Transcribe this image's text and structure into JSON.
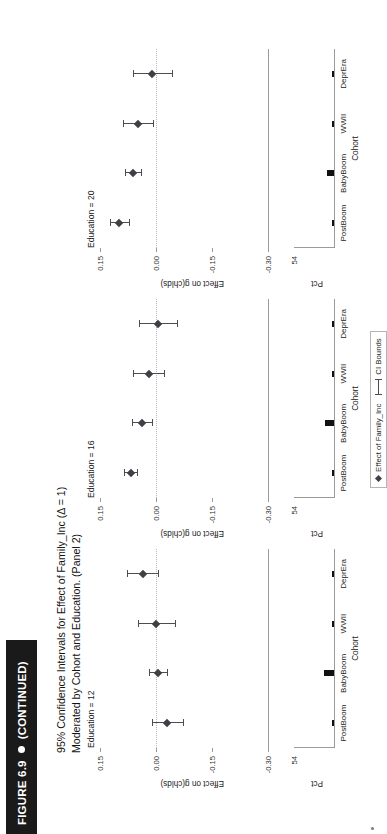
{
  "figure": {
    "label": "FIGURE 6.9",
    "continued": "(CONTINUED)",
    "title_line1": "95% Confidence Intervals for Effect of Family_Inc (Δ = 1)",
    "title_line2": "Moderated by Cohort and Education. (Panel 2)"
  },
  "legend": {
    "effect_label": "Effect of Family_Inc",
    "ci_label": "CI Bounds"
  },
  "axes": {
    "ylabel": "Effect on g(chlds)",
    "pct_label": "Pct",
    "xlabel": "Cohort",
    "yticks": [
      "0.15",
      "0.00",
      "-0.15",
      "-0.30"
    ],
    "pct_ticks": [
      "54"
    ],
    "categories": [
      "PostBoom",
      "BabyBoom",
      "WWII",
      "DeprEra"
    ]
  },
  "chart_data": {
    "type": "scatter",
    "title": "95% Confidence Intervals for Effect of Family_Inc (Δ = 1) Moderated by Cohort and Education. (Panel 2)",
    "xlabel": "Cohort",
    "ylabel": "Effect on g(chlds)",
    "ylim": [
      -0.3,
      0.15
    ],
    "yticks": [
      0.15,
      0.0,
      -0.15,
      -0.3
    ],
    "grid": false,
    "legend_position": "bottom-center",
    "categories": [
      "PostBoom",
      "BabyBoom",
      "WWII",
      "DeprEra"
    ],
    "panels": [
      {
        "name": "Education = 12",
        "series": [
          {
            "name": "Effect of Family_Inc",
            "estimates": [
              -0.03,
              -0.005,
              0.0,
              0.035
            ],
            "ci_low": [
              -0.072,
              -0.03,
              -0.052,
              -0.005
            ],
            "ci_high": [
              0.012,
              0.02,
              0.048,
              0.078
            ]
          }
        ],
        "pct": {
          "label": "Pct",
          "values": [
            2.0,
            14.0,
            2.5,
            2.0
          ],
          "ylim": [
            0,
            54
          ]
        }
      },
      {
        "name": "Education = 16",
        "series": [
          {
            "name": "Effect of Family_Inc",
            "estimates": [
              0.068,
              0.038,
              0.02,
              -0.005
            ],
            "ci_low": [
              0.05,
              0.012,
              -0.022,
              -0.055
            ],
            "ci_high": [
              0.086,
              0.064,
              0.062,
              0.045
            ]
          }
        ],
        "pct": {
          "label": "Pct",
          "values": [
            2.0,
            12.0,
            2.0,
            1.5
          ],
          "ylim": [
            0,
            54
          ]
        }
      },
      {
        "name": "Education = 20",
        "series": [
          {
            "name": "Effect of Family_Inc",
            "estimates": [
              0.098,
              0.062,
              0.048,
              0.01
            ],
            "ci_low": [
              0.072,
              0.04,
              0.008,
              -0.042
            ],
            "ci_high": [
              0.124,
              0.084,
              0.088,
              0.062
            ]
          }
        ],
        "pct": {
          "label": "Pct",
          "values": [
            1.5,
            9.0,
            1.8,
            1.2
          ],
          "ylim": [
            0,
            54
          ]
        }
      }
    ]
  }
}
